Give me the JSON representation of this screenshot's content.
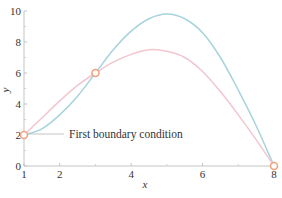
{
  "chart_data": {
    "type": "line",
    "title": "",
    "xlabel": "x",
    "ylabel": "y",
    "xlim": [
      1,
      8
    ],
    "ylim": [
      0,
      10
    ],
    "x_ticks": [
      1,
      2,
      4,
      6,
      8
    ],
    "x_tick_labels": [
      "1",
      "2",
      "4",
      "6",
      "8"
    ],
    "x_minor_ticks": [
      3,
      5,
      7
    ],
    "y_ticks": [
      0,
      2,
      4,
      6,
      8,
      10
    ],
    "y_tick_labels": [
      "0",
      "2",
      "4",
      "6",
      "8",
      "10"
    ],
    "y_minor_ticks": [
      1,
      3,
      5,
      7,
      9
    ],
    "grid": false,
    "series": [
      {
        "name": "solution-curve-blue",
        "color": "#a7d3dc",
        "x": [
          1,
          1.5,
          2,
          2.5,
          3,
          3.5,
          4,
          4.5,
          5,
          5.5,
          6,
          6.5,
          7,
          7.5,
          8
        ],
        "y": [
          2,
          2.4,
          3.3,
          4.5,
          6.0,
          7.5,
          8.7,
          9.5,
          9.8,
          9.5,
          8.6,
          7.0,
          4.9,
          2.6,
          0
        ]
      },
      {
        "name": "solution-curve-pink",
        "color": "#f2c6cf",
        "x": [
          1,
          1.5,
          2,
          2.5,
          3,
          3.5,
          4,
          4.5,
          5,
          5.5,
          6,
          6.5,
          7,
          7.5,
          8
        ],
        "y": [
          2,
          3.1,
          4.2,
          5.2,
          6.0,
          6.7,
          7.2,
          7.5,
          7.4,
          7.0,
          6.1,
          4.8,
          3.3,
          1.7,
          0
        ]
      }
    ],
    "markers": [
      {
        "x": 1,
        "y": 2,
        "style": "open-circle",
        "color": "#f0a07a"
      },
      {
        "x": 3,
        "y": 6,
        "style": "open-circle",
        "color": "#f0a07a"
      },
      {
        "x": 8,
        "y": 0,
        "style": "open-circle",
        "color": "#f0a07a"
      }
    ],
    "annotations": [
      {
        "text": "First boundary condition",
        "points_to": {
          "x": 1,
          "y": 2
        }
      }
    ],
    "axis_color": "#bfbfbf"
  }
}
